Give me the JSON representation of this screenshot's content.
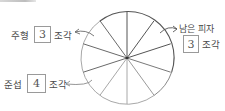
{
  "figure": {
    "type": "pizza-fraction-diagram",
    "total_slices": 10,
    "colors": {
      "remaining_outline": "#444444",
      "eaten_outline": "#9a9a9a",
      "arrow": "#6a6a6a",
      "box_border": "#9a9a9a"
    }
  },
  "labels": {
    "juhyeong": {
      "name": "주형",
      "value": "3",
      "unit": "조각"
    },
    "junseop": {
      "name": "준섭",
      "value": "4",
      "unit": "조각"
    },
    "remaining": {
      "title": "남은 피자",
      "value": "3",
      "unit": "조각"
    }
  }
}
